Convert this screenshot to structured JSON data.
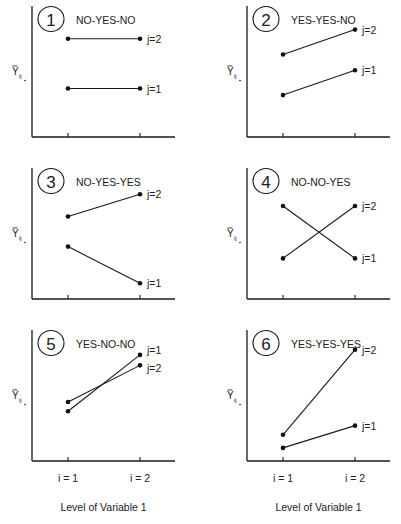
{
  "figure": {
    "x_title": "Level of Variable 1",
    "y_label_main": "Y",
    "y_label_sub": "ij",
    "x_ticks": [
      "i = 1",
      "i = 2"
    ]
  },
  "chart_data": [
    {
      "type": "line",
      "panel": 1,
      "title": "NO-YES-NO",
      "categories": [
        "i = 1",
        "i = 2"
      ],
      "xlabel": "Level of Variable 1",
      "ylabel": "Ȳij.",
      "series": [
        {
          "name": "j=2",
          "values": [
            0.75,
            0.75
          ]
        },
        {
          "name": "j=1",
          "values": [
            0.37,
            0.37
          ]
        }
      ]
    },
    {
      "type": "line",
      "panel": 2,
      "title": "YES-YES-NO",
      "categories": [
        "i = 1",
        "i = 2"
      ],
      "xlabel": "Level of Variable 1",
      "ylabel": "Ȳij.",
      "series": [
        {
          "name": "j=2",
          "values": [
            0.63,
            0.82
          ]
        },
        {
          "name": "j=1",
          "values": [
            0.32,
            0.51
          ]
        }
      ]
    },
    {
      "type": "line",
      "panel": 3,
      "title": "NO-YES-YES",
      "categories": [
        "i = 1",
        "i = 2"
      ],
      "xlabel": "Level of Variable 1",
      "ylabel": "Ȳij.",
      "series": [
        {
          "name": "j=2",
          "values": [
            0.63,
            0.8
          ]
        },
        {
          "name": "j=1",
          "values": [
            0.4,
            0.12
          ]
        }
      ]
    },
    {
      "type": "line",
      "panel": 4,
      "title": "NO-NO-YES",
      "categories": [
        "i = 1",
        "i = 2"
      ],
      "xlabel": "Level of Variable 1",
      "ylabel": "Ȳij.",
      "series": [
        {
          "name": "j=2",
          "values": [
            0.31,
            0.71
          ]
        },
        {
          "name": "j=1",
          "values": [
            0.71,
            0.31
          ]
        }
      ]
    },
    {
      "type": "line",
      "panel": 5,
      "title": "YES-NO-NO",
      "categories": [
        "i = 1",
        "i = 2"
      ],
      "xlabel": "Level of Variable 1",
      "ylabel": "Ȳij.",
      "series": [
        {
          "name": "j=1",
          "values": [
            0.38,
            0.81
          ]
        },
        {
          "name": "j=2",
          "values": [
            0.45,
            0.73
          ]
        }
      ]
    },
    {
      "type": "line",
      "panel": 6,
      "title": "YES-YES-YES",
      "categories": [
        "i = 1",
        "i = 2"
      ],
      "xlabel": "Level of Variable 1",
      "ylabel": "Ȳij.",
      "series": [
        {
          "name": "j=2",
          "values": [
            0.2,
            0.85
          ]
        },
        {
          "name": "j=1",
          "values": [
            0.1,
            0.27
          ]
        }
      ]
    }
  ]
}
